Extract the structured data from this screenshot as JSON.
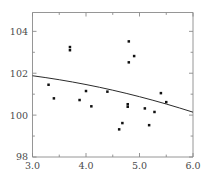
{
  "chart_data": {
    "type": "scatter",
    "title": "",
    "xlabel": "",
    "ylabel": "",
    "xlim": [
      3.0,
      6.0
    ],
    "ylim": [
      98,
      104.9
    ],
    "xticks": [
      3.0,
      4.0,
      5.0,
      6.0
    ],
    "xtick_labels": [
      "3.0",
      "4.0",
      "5.0",
      "6.0"
    ],
    "yticks": [
      98,
      100,
      102,
      104
    ],
    "ytick_labels": [
      "98",
      "100",
      "102",
      "104"
    ],
    "yticks_minor": [
      99,
      101,
      103
    ],
    "xticks_minor": [
      3.5,
      4.5,
      5.5
    ],
    "grid": false,
    "legend": null,
    "point_color": "#111111",
    "line_color": "#2b2b2b",
    "axis_color": "#8a8a8a",
    "label_color": "#4a4a4a",
    "series": [
      {
        "name": "observations",
        "marker": "square",
        "points": [
          {
            "x": 3.3,
            "y": 101.45
          },
          {
            "x": 3.4,
            "y": 100.8
          },
          {
            "x": 3.7,
            "y": 103.25
          },
          {
            "x": 3.7,
            "y": 103.1
          },
          {
            "x": 3.88,
            "y": 100.72
          },
          {
            "x": 4.0,
            "y": 101.15
          },
          {
            "x": 4.1,
            "y": 100.42
          },
          {
            "x": 4.4,
            "y": 101.12
          },
          {
            "x": 4.62,
            "y": 99.32
          },
          {
            "x": 4.68,
            "y": 99.62
          },
          {
            "x": 4.78,
            "y": 100.52
          },
          {
            "x": 4.78,
            "y": 100.4
          },
          {
            "x": 4.8,
            "y": 103.52
          },
          {
            "x": 4.8,
            "y": 102.52
          },
          {
            "x": 4.9,
            "y": 102.82
          },
          {
            "x": 5.1,
            "y": 100.32
          },
          {
            "x": 5.18,
            "y": 99.52
          },
          {
            "x": 5.28,
            "y": 100.15
          },
          {
            "x": 5.4,
            "y": 101.05
          },
          {
            "x": 5.5,
            "y": 100.62
          }
        ]
      }
    ],
    "fit_curve": {
      "name": "fitted regression curve",
      "style": "solid",
      "points": [
        {
          "x": 3.0,
          "y": 101.88
        },
        {
          "x": 3.25,
          "y": 101.79
        },
        {
          "x": 3.5,
          "y": 101.69
        },
        {
          "x": 3.75,
          "y": 101.58
        },
        {
          "x": 4.0,
          "y": 101.46
        },
        {
          "x": 4.25,
          "y": 101.33
        },
        {
          "x": 4.5,
          "y": 101.19
        },
        {
          "x": 4.75,
          "y": 101.04
        },
        {
          "x": 5.0,
          "y": 100.88
        },
        {
          "x": 5.25,
          "y": 100.71
        },
        {
          "x": 5.5,
          "y": 100.53
        },
        {
          "x": 5.75,
          "y": 100.34
        },
        {
          "x": 6.0,
          "y": 100.14
        }
      ]
    }
  }
}
